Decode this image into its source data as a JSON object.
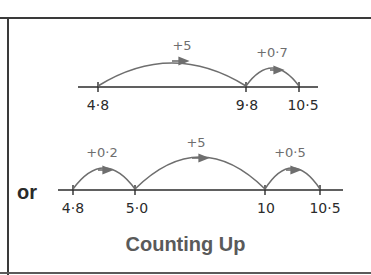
{
  "title": "Counting Up",
  "connector": "or",
  "colors": {
    "line": "#2b2b2b",
    "arc": "#6e6e6e",
    "title": "#5a5a5a",
    "frame": "#3a3a3a"
  },
  "method1": {
    "ticks": [
      "4·8",
      "9·8",
      "10·5"
    ],
    "jumps": [
      {
        "label": "+5",
        "from": "4·8",
        "to": "9·8"
      },
      {
        "label": "+0·7",
        "from": "9·8",
        "to": "10·5"
      }
    ]
  },
  "method2": {
    "ticks": [
      "4·8",
      "5·0",
      "10",
      "10·5"
    ],
    "jumps": [
      {
        "label": "+0·2",
        "from": "4·8",
        "to": "5·0"
      },
      {
        "label": "+5",
        "from": "5·0",
        "to": "10"
      },
      {
        "label": "+0·5",
        "from": "10",
        "to": "10·5"
      }
    ]
  }
}
